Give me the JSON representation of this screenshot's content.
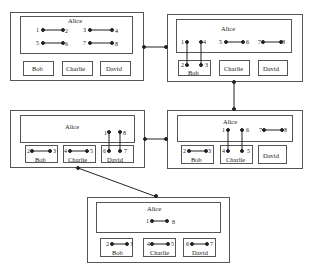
{
  "diagram": {
    "type": "state-transition",
    "states": [
      {
        "id": "s1",
        "root": "Alice",
        "root_edges": [
          [
            "1",
            "2"
          ],
          [
            "3",
            "4"
          ],
          [
            "5",
            "6"
          ],
          [
            "7",
            "8"
          ]
        ],
        "children": [
          {
            "name": "Bob",
            "edges": []
          },
          {
            "name": "Charlie",
            "edges": []
          },
          {
            "name": "David",
            "edges": []
          }
        ]
      },
      {
        "id": "s2",
        "root": "Alice",
        "root_edges": [
          [
            "5",
            "6"
          ],
          [
            "7",
            "8"
          ]
        ],
        "cross_edges": [
          [
            "1",
            "2"
          ],
          [
            "4",
            "3"
          ]
        ],
        "children": [
          {
            "name": "Bob",
            "labels": [
              "2",
              "3"
            ]
          },
          {
            "name": "Charlie",
            "edges": []
          },
          {
            "name": "David",
            "edges": []
          }
        ]
      },
      {
        "id": "s3",
        "root": "Alice",
        "root_edges": [
          [
            "7",
            "8"
          ]
        ],
        "cross_edges": [
          [
            "1",
            "4"
          ],
          [
            "6",
            "5"
          ]
        ],
        "children": [
          {
            "name": "Bob",
            "edges": [
              [
                "2",
                "3"
              ]
            ]
          },
          {
            "name": "Charlie",
            "labels": [
              "4",
              "5"
            ]
          },
          {
            "name": "David",
            "edges": []
          }
        ]
      },
      {
        "id": "s4",
        "root": "Alice",
        "root_edges": [],
        "cross_edges": [
          [
            "1",
            "6"
          ],
          [
            "8",
            "7"
          ]
        ],
        "children": [
          {
            "name": "Bob",
            "edges": [
              [
                "2",
                "3"
              ]
            ]
          },
          {
            "name": "Charlie",
            "edges": [
              [
                "4",
                "5"
              ]
            ]
          },
          {
            "name": "David",
            "labels": [
              "6",
              "7"
            ]
          }
        ]
      },
      {
        "id": "s5",
        "root": "Alice",
        "root_edges": [
          [
            "1",
            "8"
          ]
        ],
        "children": [
          {
            "name": "Bob",
            "edges": [
              [
                "2",
                "3"
              ]
            ]
          },
          {
            "name": "Charlie",
            "edges": [
              [
                "4",
                "5"
              ]
            ]
          },
          {
            "name": "David",
            "edges": [
              [
                "6",
                "7"
              ]
            ]
          }
        ]
      }
    ],
    "transitions": [
      [
        "s1",
        "s2"
      ],
      [
        "s2",
        "s3"
      ],
      [
        "s3",
        "s4"
      ],
      [
        "s4",
        "s5"
      ]
    ]
  },
  "labels": {
    "alice": "Alice",
    "bob": "Bob",
    "charlie": "Charlie",
    "david": "David",
    "n1": "1",
    "n2": "2",
    "n3": "3",
    "n4": "4",
    "n5": "5",
    "n6": "6",
    "n7": "7",
    "n8": "8"
  },
  "colors": {
    "line": "#222222",
    "border": "#555555",
    "background": "#ffffff"
  }
}
